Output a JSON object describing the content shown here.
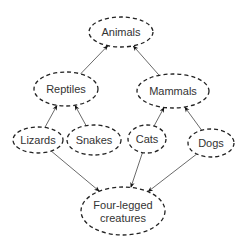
{
  "diagram": {
    "title": "",
    "nodes": [
      {
        "id": "animals",
        "label": "Animals"
      },
      {
        "id": "reptiles",
        "label": "Reptiles"
      },
      {
        "id": "mammals",
        "label": "Mammals"
      },
      {
        "id": "lizards",
        "label": "Lizards"
      },
      {
        "id": "snakes",
        "label": "Snakes"
      },
      {
        "id": "cats",
        "label": "Cats"
      },
      {
        "id": "dogs",
        "label": "Dogs"
      },
      {
        "id": "four_legged",
        "label": "Four-legged creatures",
        "lines": [
          "Four-legged",
          "creatures"
        ]
      }
    ],
    "edges": [
      {
        "from": "reptiles",
        "to": "animals"
      },
      {
        "from": "mammals",
        "to": "animals"
      },
      {
        "from": "lizards",
        "to": "reptiles"
      },
      {
        "from": "snakes",
        "to": "reptiles"
      },
      {
        "from": "cats",
        "to": "mammals"
      },
      {
        "from": "dogs",
        "to": "mammals"
      },
      {
        "from": "lizards",
        "to": "four_legged"
      },
      {
        "from": "cats",
        "to": "four_legged"
      },
      {
        "from": "dogs",
        "to": "four_legged"
      }
    ]
  }
}
